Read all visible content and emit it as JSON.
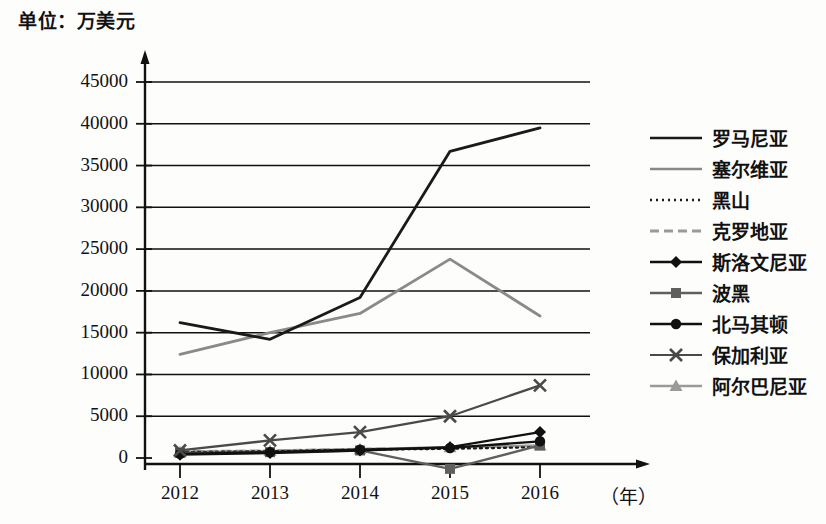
{
  "unit_label": "单位：万美元",
  "x_unit": "（年）",
  "axis": {
    "y_ticks": [
      "0",
      "5000",
      "10000",
      "15000",
      "20000",
      "25000",
      "30000",
      "35000",
      "40000",
      "45000"
    ],
    "x_ticks": [
      "2012",
      "2013",
      "2014",
      "2015",
      "2016"
    ]
  },
  "colors": {
    "dark": "#1a1a1a",
    "mid": "#6e6e6e",
    "light": "#a8a8a8",
    "axis": "#111111"
  },
  "legend": {
    "items": [
      {
        "label": "罗马尼亚",
        "key": "plain-dark-line-key",
        "color": "#1a1a1a",
        "marker": "none",
        "dash": "none",
        "width": 2.6
      },
      {
        "label": "塞尔维亚",
        "key": "plain-gray-line-key",
        "color": "#8a8a8a",
        "marker": "none",
        "dash": "none",
        "width": 2.6
      },
      {
        "label": "黑山",
        "key": "dotted-dark-line-key",
        "color": "#1a1a1a",
        "marker": "none",
        "dash": "dotted",
        "width": 2.6
      },
      {
        "label": "克罗地亚",
        "key": "dashed-gray-line-key",
        "color": "#9a9a9a",
        "marker": "none",
        "dash": "dashed",
        "width": 3.0
      },
      {
        "label": "斯洛文尼亚",
        "key": "diamond-marker-line-key",
        "color": "#111111",
        "marker": "diamond",
        "dash": "none",
        "width": 2.4
      },
      {
        "label": "波黑",
        "key": "square-marker-line-key",
        "color": "#5f5f5f",
        "marker": "square",
        "dash": "none",
        "width": 2.4
      },
      {
        "label": "北马其顿",
        "key": "circle-marker-line-key",
        "color": "#111111",
        "marker": "circle",
        "dash": "none",
        "width": 2.4
      },
      {
        "label": "保加利亚",
        "key": "cross-marker-line-key",
        "color": "#4a4a4a",
        "marker": "cross",
        "dash": "none",
        "width": 2.2
      },
      {
        "label": "阿尔巴尼亚",
        "key": "triangle-marker-line-key",
        "color": "#9a9a9a",
        "marker": "triangle",
        "dash": "none",
        "width": 2.4
      }
    ]
  },
  "chart_data": {
    "type": "line",
    "title": "",
    "subtitle": "",
    "xlabel": "（年）",
    "ylabel": "单位：万美元",
    "categories": [
      "2012",
      "2013",
      "2014",
      "2015",
      "2016"
    ],
    "x": [
      2012,
      2013,
      2014,
      2015,
      2016
    ],
    "ylim": [
      0,
      45000
    ],
    "y_tick_step": 5000,
    "grid": "horizontal",
    "legend_position": "right",
    "series": [
      {
        "name": "罗马尼亚",
        "values": [
          16200,
          14200,
          19200,
          36700,
          39500
        ],
        "color": "#1a1a1a",
        "marker": "none",
        "dash": "none"
      },
      {
        "name": "塞尔维亚",
        "values": [
          12400,
          15000,
          17300,
          23800,
          17000
        ],
        "color": "#8a8a8a",
        "marker": "none",
        "dash": "none"
      },
      {
        "name": "黑山",
        "values": [
          700,
          800,
          1000,
          1100,
          1300
        ],
        "color": "#1a1a1a",
        "marker": "none",
        "dash": "dotted"
      },
      {
        "name": "克罗地亚",
        "values": [
          800,
          900,
          1100,
          1250,
          1450
        ],
        "color": "#9a9a9a",
        "marker": "none",
        "dash": "dashed"
      },
      {
        "name": "斯洛文尼亚",
        "values": [
          400,
          600,
          900,
          1300,
          3100
        ],
        "color": "#111111",
        "marker": "diamond",
        "dash": "none"
      },
      {
        "name": "波黑",
        "values": [
          600,
          700,
          900,
          -1300,
          1500
        ],
        "color": "#5f5f5f",
        "marker": "square",
        "dash": "none"
      },
      {
        "name": "北马其顿",
        "values": [
          500,
          700,
          1000,
          1200,
          2000
        ],
        "color": "#111111",
        "marker": "circle",
        "dash": "none"
      },
      {
        "name": "保加利亚",
        "values": [
          900,
          2100,
          3100,
          5000,
          8700
        ],
        "color": "#4a4a4a",
        "marker": "cross",
        "dash": "none"
      },
      {
        "name": "阿尔巴尼亚",
        "values": [
          700,
          850,
          1050,
          1300,
          1500
        ],
        "color": "#9a9a9a",
        "marker": "triangle",
        "dash": "none"
      }
    ]
  }
}
